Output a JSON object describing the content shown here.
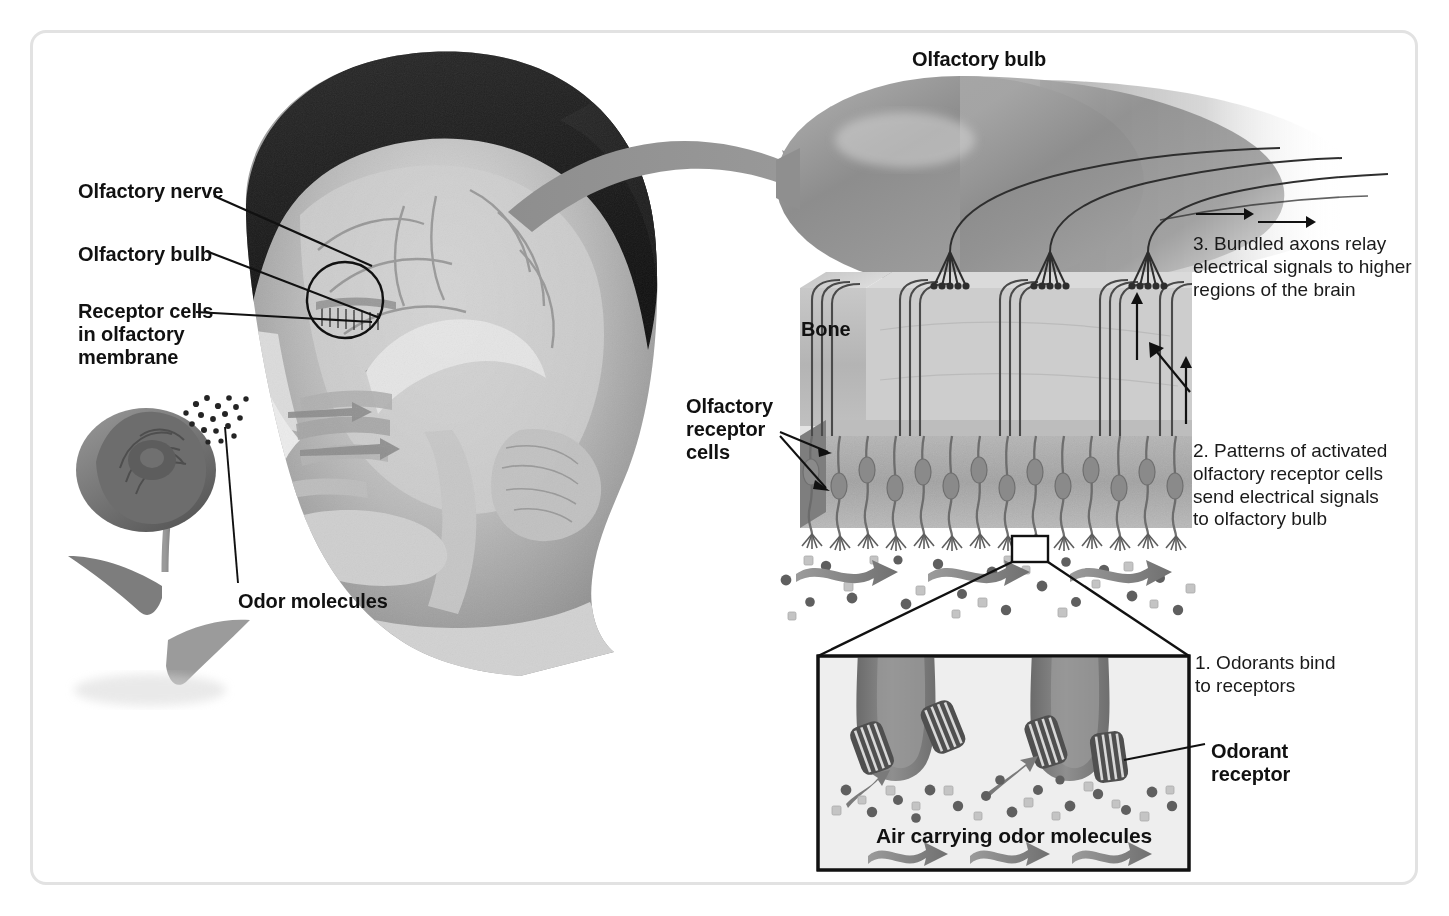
{
  "figure": {
    "border_color": "#e2e2e2",
    "background": "#ffffff"
  },
  "left_panel": {
    "labels": [
      {
        "id": "olfactory-nerve",
        "text": "Olfactory nerve",
        "x": 78,
        "y": 180
      },
      {
        "id": "olfactory-bulb",
        "text": "Olfactory bulb",
        "x": 78,
        "y": 243
      },
      {
        "id": "receptor-cells",
        "text": "Receptor cells\nin olfactory\nmembrane",
        "x": 78,
        "y": 300
      },
      {
        "id": "odor-molecules",
        "text": "Odor molecules",
        "x": 238,
        "y": 590
      }
    ],
    "head_image_alt": "Grayscale mid-sagittal section of a human head showing brain, nasal cavity and olfactory region",
    "rose_alt": "Grayscale rose emitting odor molecules toward the nose",
    "circle_highlight": {
      "cx": 345,
      "cy": 300,
      "r": 38
    }
  },
  "right_panel": {
    "title": {
      "text": "Olfactory bulb",
      "x": 912,
      "y": 48
    },
    "bone_label": {
      "text": "Bone",
      "x": 801,
      "y": 318
    },
    "receptor_cells_label": {
      "text": "Olfactory\nreceptor\ncells",
      "x": 686,
      "y": 395
    },
    "steps": [
      {
        "number": "3.",
        "text": "3. Bundled axons relay\nelectrical signals to higher\nregions of the brain",
        "x": 1193,
        "y": 233
      },
      {
        "number": "2.",
        "text": "2. Patterns of activated\nolfactory receptor cells\nsend electrical  signals\nto olfactory bulb",
        "x": 1193,
        "y": 440
      },
      {
        "number": "1.",
        "text": "1. Odorants bind\nto receptors",
        "x": 1195,
        "y": 652
      }
    ],
    "glomeruli_count": 3,
    "receptor_cell_count": 14,
    "axon_bundle_count": 4
  },
  "inset": {
    "caption": {
      "text": "Air carrying odor molecules",
      "x": 1005,
      "y": 838
    },
    "odorant_receptor_label": {
      "text": "Odorant\nreceptor",
      "x": 1211,
      "y": 740
    },
    "box": {
      "x": 816,
      "y": 654,
      "width": 375,
      "height": 218
    },
    "magnifier_source": {
      "x": 1012,
      "y": 536,
      "width": 36,
      "height": 26
    },
    "dendritic_knob_count": 2,
    "receptor_barrel_count": 4,
    "airflow_arrow_count": 3,
    "background": "#eeeeee"
  },
  "colors": {
    "text": "#111111",
    "line": "#111111",
    "big_arrow": "#8b8b8b",
    "bulb_dark": "#6f6f6f",
    "bulb_light": "#b8b8b8",
    "bone_face": "#b5b5b5",
    "bone_side": "#8f8f8f",
    "epithelium": "#9c9c9c",
    "knob": "#7a7a7a",
    "molecule_dark": "#5a5a5a",
    "molecule_light": "#c9c9c9"
  }
}
